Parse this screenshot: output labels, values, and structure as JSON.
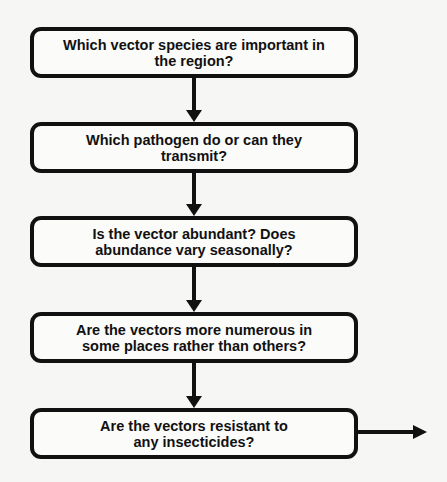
{
  "diagram": {
    "type": "flowchart",
    "direction": "top-to-bottom",
    "nodes": [
      {
        "id": "n1",
        "label": "Which vector species are important in the region?"
      },
      {
        "id": "n2",
        "label": "Which pathogen do or can they transmit?"
      },
      {
        "id": "n3",
        "label": "Is the vector abundant? Does abundance vary seasonally?"
      },
      {
        "id": "n4",
        "label": "Are the vectors more numerous in some places rather than others?"
      },
      {
        "id": "n5",
        "label": "Are the vectors resistant to any insecticides?"
      }
    ],
    "edges": [
      {
        "from": "n1",
        "to": "n2"
      },
      {
        "from": "n2",
        "to": "n3"
      },
      {
        "from": "n3",
        "to": "n4"
      },
      {
        "from": "n4",
        "to": "n5"
      },
      {
        "from": "n5",
        "to": "off-page-right"
      }
    ],
    "colors": {
      "stroke": "#111111",
      "box_fill": "#fbfbfa",
      "background": "#f6f6f4"
    }
  }
}
